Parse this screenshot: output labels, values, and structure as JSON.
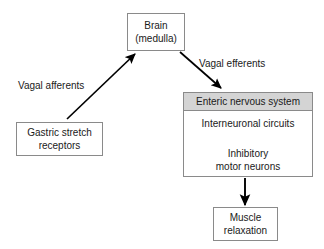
{
  "diagram": {
    "colors": {
      "background": "#ffffff",
      "box_border": "#8a8a8a",
      "box_fill": "#ffffff",
      "header_fill": "#d4d4d4",
      "text": "#1a1a1a",
      "arrow": "#000000"
    },
    "nodes": {
      "brain": {
        "lines": [
          "Brain",
          "(medulla)"
        ],
        "line1": "Brain",
        "line2": "(medulla)"
      },
      "gastric_stretch_receptors": {
        "line1": "Gastric stretch",
        "line2": "receptors"
      },
      "enteric_nervous_system": {
        "header": "Enteric nervous system",
        "interneuronal": "Interneuronal circuits",
        "inhibitory_line1": "Inhibitory",
        "inhibitory_line2": "motor neurons"
      },
      "muscle_relaxation": {
        "line1": "Muscle",
        "line2": "relaxation"
      }
    },
    "edges": [
      {
        "id": "afferent",
        "label": "Vagal afferents",
        "from": "gastric_stretch_receptors",
        "to": "brain",
        "direction": "up-right"
      },
      {
        "id": "efferent",
        "label": "Vagal efferents",
        "from": "brain",
        "to": "enteric_nervous_system",
        "direction": "down-right"
      },
      {
        "id": "interneuron-to-motor",
        "label": "",
        "from": "interneuronal_circuits",
        "to": "inhibitory_motor_neurons",
        "direction": "down"
      },
      {
        "id": "ens-to-muscle",
        "label": "",
        "from": "enteric_nervous_system",
        "to": "muscle_relaxation",
        "direction": "down"
      }
    ],
    "labels": {
      "vagal_afferents": "Vagal afferents",
      "vagal_efferents": "Vagal efferents"
    }
  }
}
